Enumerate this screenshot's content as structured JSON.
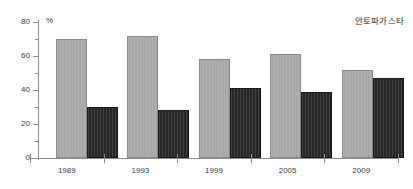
{
  "corner_label": "안토파가스타",
  "unit_symbol": "%",
  "chart_data": {
    "type": "bar",
    "title": "",
    "subtitle": "",
    "xlabel": "",
    "ylabel": "%",
    "ylim": [
      0,
      80
    ],
    "yticks": [
      0,
      20,
      40,
      60,
      80
    ],
    "yticks_minor": [
      10,
      30,
      50,
      70
    ],
    "grid": false,
    "legend_position": "none",
    "annotation": "안토파가스타",
    "categories": [
      "1989",
      "1993",
      "1999",
      "2005",
      "2009"
    ],
    "series": [
      {
        "name": "light-series",
        "color": "#a8a8a8",
        "values": [
          70,
          72,
          58,
          61,
          52
        ]
      },
      {
        "name": "dark-series",
        "color": "#262626",
        "values": [
          30,
          28,
          41,
          39,
          47
        ]
      }
    ]
  },
  "axis": {
    "y_tick_labels": [
      "0",
      "20",
      "40",
      "60",
      "80"
    ],
    "x_tick_labels": [
      "1989",
      "1993",
      "1999",
      "2005",
      "2009"
    ]
  }
}
